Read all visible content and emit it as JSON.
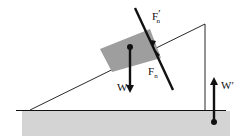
{
  "diagram": {
    "labels": {
      "normal_on_wedge": "F",
      "normal_on_wedge_sub": "n",
      "normal_on_wedge_prime": "′",
      "normal_on_block": "F",
      "normal_on_block_sub": "n",
      "weight_block": "W",
      "weight_wedge_reaction": "W",
      "weight_wedge_reaction_prime": "′"
    },
    "colors": {
      "floor": "#d4d4d4",
      "block": "#9e9e9e",
      "line": "#111111",
      "arrow": "#111111"
    }
  }
}
